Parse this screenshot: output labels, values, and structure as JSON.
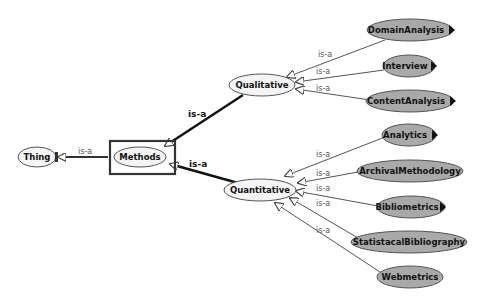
{
  "diagram": {
    "type": "ontology-class-hierarchy",
    "nodes": {
      "thing": {
        "label": "Thing",
        "style": "open"
      },
      "methods": {
        "label": "Methods",
        "style": "open",
        "selected": true
      },
      "qualitative": {
        "label": "Qualitative",
        "style": "open"
      },
      "quantitative": {
        "label": "Quantitative",
        "style": "open"
      },
      "domain_analysis": {
        "label": "DomainAnalysis",
        "style": "filled",
        "expandable": true
      },
      "interview": {
        "label": "Interview",
        "style": "filled",
        "expandable": true
      },
      "content_analysis": {
        "label": "ContentAnalysis",
        "style": "filled",
        "expandable": true
      },
      "analytics": {
        "label": "Analytics",
        "style": "filled",
        "expandable": true
      },
      "archival_methodology": {
        "label": "ArchivalMethodology",
        "style": "filled",
        "expandable": false
      },
      "bibliometrics": {
        "label": "Bibliometrics",
        "style": "filled",
        "expandable": true
      },
      "statistacal_bibliography": {
        "label": "StatistacalBibliography",
        "style": "filled",
        "expandable": false
      },
      "webmetrics": {
        "label": "Webmetrics",
        "style": "filled",
        "expandable": false
      }
    },
    "edges": {
      "methods_thing": {
        "from": "Methods",
        "to": "Thing",
        "label": "is-a"
      },
      "qualitative_methods": {
        "from": "Qualitative",
        "to": "Methods",
        "label": "is-a"
      },
      "quantitative_methods": {
        "from": "Quantitative",
        "to": "Methods",
        "label": "is-a"
      },
      "domain_analysis_qualitative": {
        "from": "DomainAnalysis",
        "to": "Qualitative",
        "label": "is-a"
      },
      "interview_qualitative": {
        "from": "Interview",
        "to": "Qualitative",
        "label": "is-a"
      },
      "content_analysis_qualitative": {
        "from": "ContentAnalysis",
        "to": "Qualitative",
        "label": "is-a"
      },
      "analytics_quantitative": {
        "from": "Analytics",
        "to": "Quantitative",
        "label": "is-a"
      },
      "archival_quantitative": {
        "from": "ArchivalMethodology",
        "to": "Quantitative",
        "label": "is-a"
      },
      "bibliometrics_quantitative": {
        "from": "Bibliometrics",
        "to": "Quantitative",
        "label": "is-a"
      },
      "statistacal_quantitative": {
        "from": "StatistacalBibliography",
        "to": "Quantitative",
        "label": "is-a"
      },
      "webmetrics_quantitative": {
        "from": "Webmetrics",
        "to": "Quantitative",
        "label": "is-a"
      }
    },
    "colors": {
      "open_fill": "#f4f4f4",
      "filled_fill": "#a9a9a9",
      "stroke": "#444444",
      "selection_box": "#333333"
    }
  }
}
